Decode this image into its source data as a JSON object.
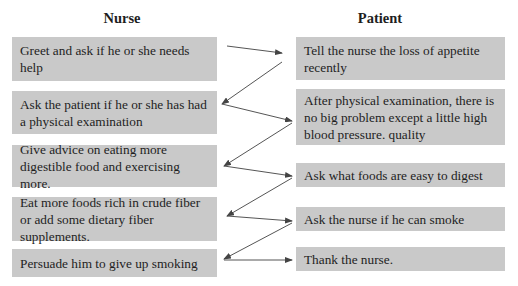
{
  "nurse": {
    "title": "Nurse",
    "steps": [
      "Greet and ask if he or she needs help",
      "Ask the patient if he or she has had a physical examination",
      "Give advice on eating more digestible food and exercising more.",
      "Eat more foods rich in crude fiber or add some dietary fiber supplements.",
      "Persuade him to give up smoking"
    ]
  },
  "patient": {
    "title": "Patient",
    "steps": [
      "Tell the nurse the loss of appetite recently",
      "After physical examination, there is no big problem except a little high blood pressure. quality",
      "Ask what foods are easy to digest",
      "Ask the nurse if he can smoke",
      "Thank the nurse."
    ]
  },
  "colors": {
    "box_fill": "#c9c9c9",
    "text": "#1e1e1e",
    "arrow": "#555555"
  },
  "arrows": [
    {
      "from": "nurse.0",
      "to": "patient.0"
    },
    {
      "from": "patient.0",
      "to": "nurse.1"
    },
    {
      "from": "nurse.1",
      "to": "patient.1"
    },
    {
      "from": "patient.1",
      "to": "nurse.2"
    },
    {
      "from": "nurse.2",
      "to": "patient.2"
    },
    {
      "from": "patient.2",
      "to": "nurse.3"
    },
    {
      "from": "nurse.3",
      "to": "patient.3"
    },
    {
      "from": "patient.3",
      "to": "nurse.4"
    },
    {
      "from": "nurse.4",
      "to": "patient.4"
    }
  ]
}
